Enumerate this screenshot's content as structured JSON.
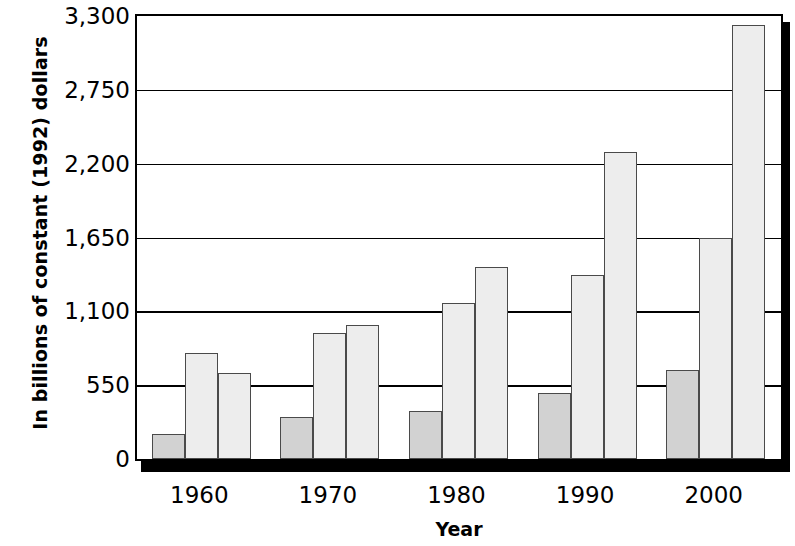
{
  "chart_data": {
    "type": "bar",
    "title": "",
    "xlabel": "Year",
    "ylabel": "In billions of constant (1992) dollars",
    "categories": [
      "1960",
      "1970",
      "1980",
      "1990",
      "2000"
    ],
    "ylim": [
      0,
      3300
    ],
    "yticks": [
      0,
      550,
      1100,
      1650,
      2200,
      2750,
      3300
    ],
    "ytick_labels": [
      "0",
      "550",
      "1,100",
      "1,650",
      "2,200",
      "2,750",
      "3,300"
    ],
    "grid": true,
    "legend": "none",
    "series": [
      {
        "name": "series-1",
        "style": "dark",
        "values": [
          190,
          310,
          360,
          490,
          660
        ]
      },
      {
        "name": "series-2",
        "style": "light",
        "values": [
          790,
          940,
          1160,
          1370,
          1650
        ]
      },
      {
        "name": "series-3",
        "style": "light",
        "values": [
          640,
          1000,
          1430,
          2290,
          3230
        ]
      }
    ],
    "colors": {
      "dark_bar_fill": "#d2d2d2",
      "light_bar_fill": "#ededed",
      "bar_outline": "#4a4a4a",
      "axis": "#000000",
      "gridline": "#000000",
      "background": "#ffffff"
    }
  }
}
